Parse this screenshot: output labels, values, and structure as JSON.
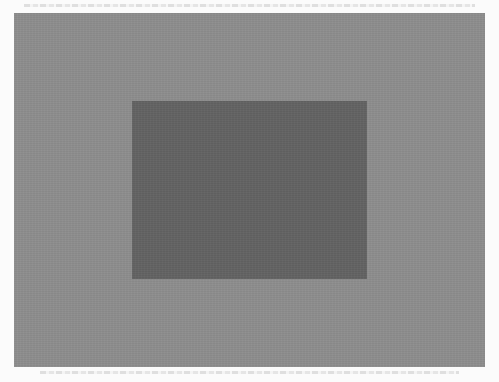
{
  "figure": {
    "outer_rect": {
      "color": "#8d8d8d",
      "x": 14,
      "y": 13,
      "width": 471,
      "height": 354
    },
    "inner_rect": {
      "color": "#636363",
      "x": 132,
      "y": 101,
      "width": 235,
      "height": 178
    },
    "page_background": "#fbfbfb"
  }
}
